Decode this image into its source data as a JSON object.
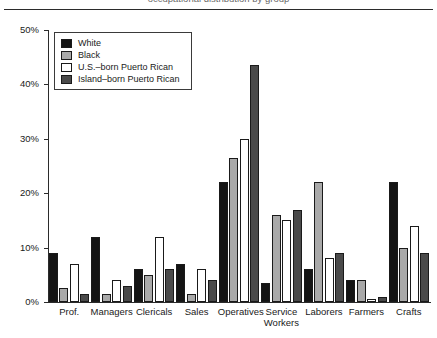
{
  "caption": {
    "clipped_line": "occupational distribution by group"
  },
  "chart_data": {
    "type": "bar",
    "title": "",
    "subtitle": "",
    "xlabel": "",
    "ylabel": "",
    "ylim": [
      0,
      50
    ],
    "yticks": [
      "0%",
      "10%",
      "20%",
      "30%",
      "40%",
      "50%"
    ],
    "ytick_values": [
      0,
      10,
      20,
      30,
      40,
      50
    ],
    "grid": false,
    "legend_position": "top-left inside",
    "categories": [
      "Prof.",
      "Managers",
      "Clericals",
      "Sales",
      "Operatives",
      "Service\nWorkers",
      "Laborers",
      "Farmers",
      "Crafts"
    ],
    "series": [
      {
        "name": "White",
        "color": "#141414",
        "values": [
          9.0,
          12.0,
          6.0,
          7.0,
          22.0,
          3.5,
          6.0,
          4.0,
          22.0
        ]
      },
      {
        "name": "Black",
        "color": "#a9a9a9",
        "values": [
          2.5,
          1.5,
          5.0,
          1.5,
          26.5,
          16.0,
          22.0,
          4.0,
          10.0
        ]
      },
      {
        "name": "U.S.–born Puerto Rican",
        "color": "#ffffff",
        "values": [
          7.0,
          4.0,
          12.0,
          6.0,
          30.0,
          15.0,
          8.0,
          0.5,
          14.0
        ]
      },
      {
        "name": "Island–born Puerto Rican",
        "color": "#4a4a4a",
        "values": [
          1.5,
          3.0,
          6.0,
          4.0,
          43.5,
          17.0,
          9.0,
          1.0,
          9.0
        ]
      }
    ]
  }
}
